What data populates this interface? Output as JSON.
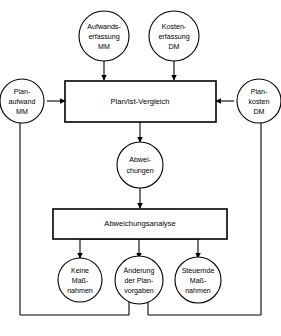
{
  "diagram": {
    "type": "flowchart",
    "language": "de",
    "background_color": "#ffffff",
    "line_color": "#000000",
    "nodes": {
      "aufwandserfassung": {
        "shape": "circle",
        "line1": "Aufwands-",
        "line2": "erfassung",
        "line3": "MM"
      },
      "kostenerfassung": {
        "shape": "circle",
        "line1": "Kosten-",
        "line2": "erfassung",
        "line3": "DM"
      },
      "planaufwand": {
        "shape": "circle",
        "line1": "Plan-",
        "line2": "aufwand",
        "line3": "MM"
      },
      "plankosten": {
        "shape": "circle",
        "line1": "Plan-",
        "line2": "kosten",
        "line3": "DM"
      },
      "plan_ist_vergleich": {
        "shape": "box",
        "label": "Plan/Ist-Vergleich"
      },
      "abweichungen": {
        "shape": "circle",
        "line1": "Abwei-",
        "line2": "chungen"
      },
      "abweichungsanalyse": {
        "shape": "box",
        "label": "Abweichungsanalyse"
      },
      "keine_massnahmen": {
        "shape": "circle",
        "line1": "Keine",
        "line2": "Maß-",
        "line3": "nahmen"
      },
      "aenderung_planvorgaben": {
        "shape": "circle",
        "line1": "Änderung",
        "line2": "der Plan-",
        "line3": "vorgaben"
      },
      "steuernde_massnahmen": {
        "shape": "circle",
        "line1": "Steuernde",
        "line2": "Maß-",
        "line3": "nahmen"
      }
    }
  }
}
